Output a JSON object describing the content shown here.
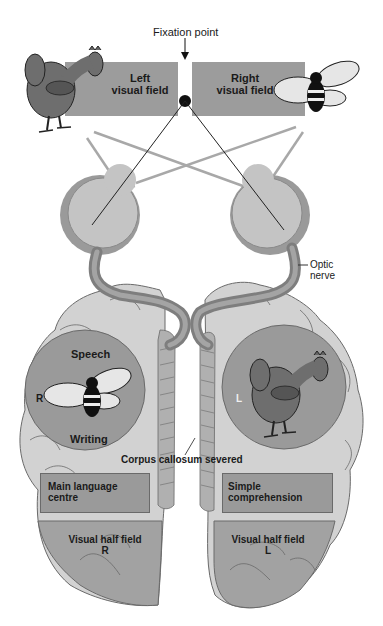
{
  "diagram": {
    "labels": {
      "fixation_point": "Fixation point",
      "left_field_line1": "Left",
      "left_field_line2": "visual field",
      "right_field_line1": "Right",
      "right_field_line2": "visual field",
      "optic_nerve_line1": "Optic",
      "optic_nerve_line2": "nerve",
      "speech": "Speech",
      "writing": "Writing",
      "left_hemisphere_side": "R",
      "right_hemisphere_side": "L",
      "corpus_callosum": "Corpus callosum severed",
      "main_language_line1": "Main language",
      "main_language_line2": "centre",
      "simple_comp_line1": "Simple",
      "simple_comp_line2": "comprehension",
      "visual_half_left_line1": "Visual half field",
      "visual_half_left_line2": "R",
      "visual_half_right_line1": "Visual half field",
      "visual_half_right_line2": "L"
    },
    "objects": {
      "left_field_object": "chicken",
      "right_field_object": "bee",
      "left_hemisphere_perceives": "bee",
      "right_hemisphere_perceives": "chicken"
    },
    "colors": {
      "field_box": "#9c9c9c",
      "brain_light": "#d2d2d2",
      "brain_mid": "#b4b4b4",
      "brain_dark": "#a0a0a0",
      "circle": "#9a9a9a",
      "nerve": "#8c8c8c",
      "outline": "#5a5a5a",
      "text": "#1a1a1a"
    }
  }
}
